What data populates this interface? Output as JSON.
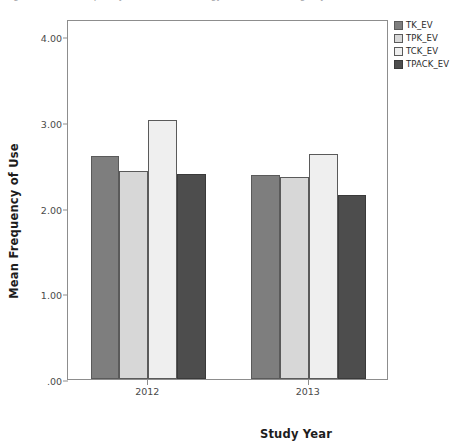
{
  "caption": {
    "text": "Figure 4. Mean frequency of use of technology-related knowledge by domain (EV)"
  },
  "chart_data": {
    "type": "bar",
    "title": "",
    "xlabel": "Study Year",
    "ylabel": "Mean Frequency of Use",
    "categories": [
      "2012",
      "2013"
    ],
    "series": [
      {
        "name": "TK_EV",
        "values": [
          2.6,
          2.38
        ],
        "color": "#7e7e7e"
      },
      {
        "name": "TPK_EV",
        "values": [
          2.43,
          2.36
        ],
        "color": "#d7d7d7"
      },
      {
        "name": "TCK_EV",
        "values": [
          3.02,
          2.63
        ],
        "color": "#efefef"
      },
      {
        "name": "TPACK_EV",
        "values": [
          2.39,
          2.15
        ],
        "color": "#4d4d4d"
      }
    ],
    "ylim": [
      0,
      4.2
    ],
    "yticks": [
      0,
      1,
      2,
      3,
      4
    ],
    "ytick_labels": [
      ".00",
      "1.00",
      "2.00",
      "3.00",
      "4.00"
    ],
    "grid": false,
    "legend_position": "right-top"
  },
  "axes": {
    "y_title": "Mean Frequency of Use",
    "x_title": "Study Year"
  },
  "legend": {
    "items": [
      {
        "label": "TK_EV"
      },
      {
        "label": "TPK_EV"
      },
      {
        "label": "TCK_EV"
      },
      {
        "label": "TPACK_EV"
      }
    ]
  }
}
